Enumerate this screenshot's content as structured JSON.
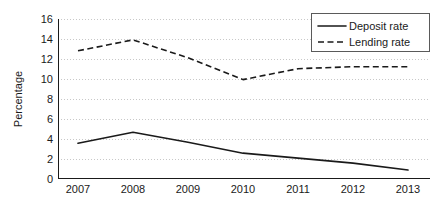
{
  "chart_data": {
    "type": "line",
    "title": "",
    "xlabel": "",
    "ylabel": "Percentage",
    "categories": [
      "2007",
      "2008",
      "2009",
      "2010",
      "2011",
      "2012",
      "2013"
    ],
    "x": [
      2007,
      2008,
      2009,
      2010,
      2011,
      2012,
      2013
    ],
    "series": [
      {
        "name": "Deposit rate",
        "style": "solid",
        "color": "#1a1a1a",
        "values": [
          3.5,
          4.6,
          3.6,
          2.5,
          2.0,
          1.5,
          0.8
        ]
      },
      {
        "name": "Lending rate",
        "style": "dashed",
        "color": "#1a1a1a",
        "values": [
          12.8,
          13.9,
          12.1,
          9.9,
          11.0,
          11.2,
          11.2
        ]
      }
    ],
    "ylim": [
      0,
      16
    ],
    "yticks": [
      0,
      2,
      4,
      6,
      8,
      10,
      12,
      14,
      16
    ],
    "ytick_labels": [
      "0",
      "2",
      "4",
      "6",
      "8",
      "10",
      "12",
      "14",
      "16"
    ],
    "xtick_labels": [
      "2007",
      "2008",
      "2009",
      "2010",
      "2011",
      "2012",
      "2013"
    ],
    "grid": true,
    "grid_axis": "y",
    "grid_color": "#c8c8c8",
    "legend_position": "top-right",
    "background": "#ffffff"
  },
  "axes": {
    "y_title": "Percentage"
  },
  "legend": {
    "entries": [
      {
        "label": "Deposit rate",
        "style": "solid"
      },
      {
        "label": "Lending rate",
        "style": "dashed"
      }
    ]
  }
}
